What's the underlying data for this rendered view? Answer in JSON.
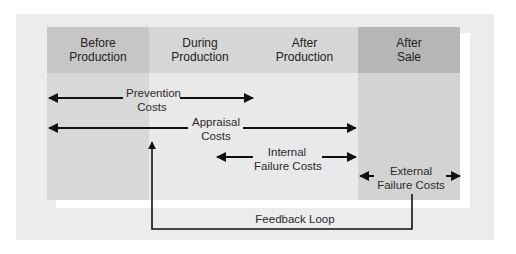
{
  "diagram": {
    "type": "cost-of-quality-timeline",
    "stages": [
      {
        "id": "before-production",
        "label_line1": "Before",
        "label_line2": "Production"
      },
      {
        "id": "during-production",
        "label_line1": "During",
        "label_line2": "Production"
      },
      {
        "id": "after-production",
        "label_line1": "After",
        "label_line2": "Production"
      },
      {
        "id": "after-sale",
        "label_line1": "After",
        "label_line2": "Sale"
      }
    ],
    "cost_categories": [
      {
        "id": "prevention",
        "line1": "Prevention",
        "line2": "Costs",
        "spans": "before-production → during-production",
        "direction": "both"
      },
      {
        "id": "appraisal",
        "line1": "Appraisal",
        "line2": "Costs",
        "spans": "before-production → after-production",
        "direction": "both"
      },
      {
        "id": "internal-failure",
        "line1": "Internal",
        "line2": "Failure Costs",
        "spans": "during-production → after-production",
        "direction": "both"
      },
      {
        "id": "external-failure",
        "line1": "External",
        "line2": "Failure Costs",
        "spans": "after-sale",
        "direction": "both"
      }
    ],
    "feedback": {
      "label": "Feedback Loop",
      "from": "after-sale",
      "to": "during-production"
    },
    "colors": {
      "panel": "#ececec",
      "before_header": "#c6c6c6",
      "mid_header": "#d6d6d6",
      "after_sale_header": "#b6b6b6",
      "arrow": "#111111"
    }
  }
}
